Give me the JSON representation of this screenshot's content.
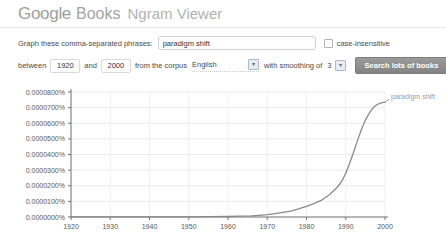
{
  "header": {
    "brand_google": "Google",
    "brand_books": "Books",
    "app_title": "Ngram Viewer"
  },
  "form": {
    "phrases_label": "Graph these comma-separated phrases:",
    "phrases_value": "paradigm shift",
    "case_insensitive_label": "case-insensitive",
    "between_label": "between",
    "year_start": "1920",
    "and_label": "and",
    "year_end": "2000",
    "corpus_label": "from the corpus",
    "corpus_value": "English",
    "smoothing_label": "with smoothing of",
    "smoothing_value": "3",
    "search_button_label": "Search lots of books"
  },
  "chart_data": {
    "type": "line",
    "title": "",
    "xlabel": "",
    "ylabel": "",
    "grid": true,
    "legend_position": "end-of-line",
    "xlim": [
      1920,
      2000
    ],
    "ylim": [
      0,
      8e-05
    ],
    "x_ticks": [
      {
        "value": 1920,
        "label": "1920"
      },
      {
        "value": 1930,
        "label": "1930"
      },
      {
        "value": 1940,
        "label": "1940"
      },
      {
        "value": 1950,
        "label": "1950"
      },
      {
        "value": 1960,
        "label": "1960"
      },
      {
        "value": 1970,
        "label": "1970"
      },
      {
        "value": 1980,
        "label": "1980"
      },
      {
        "value": 1990,
        "label": "1990"
      },
      {
        "value": 2000,
        "label": "2000"
      }
    ],
    "y_ticks": [
      {
        "value": 0.0,
        "label": "0.0000000%"
      },
      {
        "value": 1e-05,
        "label": "0.0000100%"
      },
      {
        "value": 2e-05,
        "label": "0.0000200%"
      },
      {
        "value": 3e-05,
        "label": "0.0000300%"
      },
      {
        "value": 4e-05,
        "label": "0.0000400%"
      },
      {
        "value": 5e-05,
        "label": "0.0000500%"
      },
      {
        "value": 6e-05,
        "label": "0.0000600%"
      },
      {
        "value": 7e-05,
        "label": "0.0000700%"
      },
      {
        "value": 8e-05,
        "label": "0.0000800%"
      }
    ],
    "series": [
      {
        "name": "paradigm shift",
        "color": "#8a8a8a",
        "points": [
          [
            1920,
            5e-08
          ],
          [
            1925,
            5e-08
          ],
          [
            1930,
            5e-08
          ],
          [
            1935,
            5e-08
          ],
          [
            1940,
            5e-08
          ],
          [
            1945,
            1e-07
          ],
          [
            1950,
            1e-07
          ],
          [
            1955,
            2e-07
          ],
          [
            1960,
            3e-07
          ],
          [
            1963,
            5e-07
          ],
          [
            1966,
            8e-07
          ],
          [
            1968,
            1.1e-06
          ],
          [
            1970,
            1.5e-06
          ],
          [
            1972,
            2.2e-06
          ],
          [
            1974,
            3e-06
          ],
          [
            1976,
            3.8e-06
          ],
          [
            1978,
            5.2e-06
          ],
          [
            1980,
            6.8e-06
          ],
          [
            1982,
            8.8e-06
          ],
          [
            1984,
            1.1e-05
          ],
          [
            1986,
            1.45e-05
          ],
          [
            1988,
            1.95e-05
          ],
          [
            1989,
            2.3e-05
          ],
          [
            1990,
            2.8e-05
          ],
          [
            1991,
            3.45e-05
          ],
          [
            1992,
            4.15e-05
          ],
          [
            1993,
            4.9e-05
          ],
          [
            1994,
            5.6e-05
          ],
          [
            1995,
            6.2e-05
          ],
          [
            1996,
            6.65e-05
          ],
          [
            1997,
            7e-05
          ],
          [
            1998,
            7.2e-05
          ],
          [
            1999,
            7.3e-05
          ],
          [
            2000,
            7.35e-05
          ]
        ]
      }
    ]
  }
}
